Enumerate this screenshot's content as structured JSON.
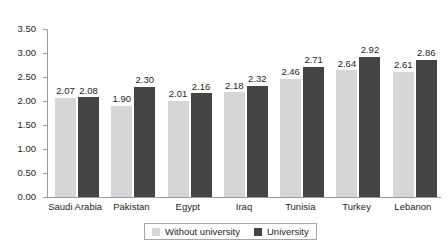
{
  "chart_data": {
    "type": "bar",
    "title": "",
    "subtitle": "",
    "xlabel": "",
    "ylabel": "",
    "ylim": [
      0.0,
      3.5
    ],
    "grid": false,
    "legend_position": "bottom",
    "categories": [
      "Saudi Arabia",
      "Pakistan",
      "Egypt",
      "Iraq",
      "Tunisia",
      "Turkey",
      "Lebanon"
    ],
    "ytick_labels": [
      "0.00",
      "0.50",
      "1.00",
      "1.50",
      "2.00",
      "2.50",
      "3.00",
      "3.50"
    ],
    "ytick_values": [
      0.0,
      0.5,
      1.0,
      1.5,
      2.0,
      2.5,
      3.0,
      3.5
    ],
    "series": [
      {
        "name": "Without university",
        "color": "#d6d6d6",
        "values": [
          2.07,
          1.9,
          2.01,
          2.18,
          2.46,
          2.64,
          2.61
        ],
        "labels": [
          "2.07",
          "1.90",
          "2.01",
          "2.18",
          "2.46",
          "2.64",
          "2.61"
        ]
      },
      {
        "name": "University",
        "color": "#444444",
        "values": [
          2.08,
          2.3,
          2.16,
          2.32,
          2.71,
          2.92,
          2.86
        ],
        "labels": [
          "2.08",
          "2.30",
          "2.16",
          "2.32",
          "2.71",
          "2.92",
          "2.86"
        ]
      }
    ]
  },
  "legend": {
    "items": [
      {
        "label": "Without university",
        "swatch": "light"
      },
      {
        "label": "University",
        "swatch": "dark"
      }
    ]
  },
  "colors": {
    "series_without_university": "#d6d6d6",
    "series_university": "#444444",
    "axis": "#9a9a9a",
    "text": "#231f20",
    "background": "#ffffff"
  }
}
